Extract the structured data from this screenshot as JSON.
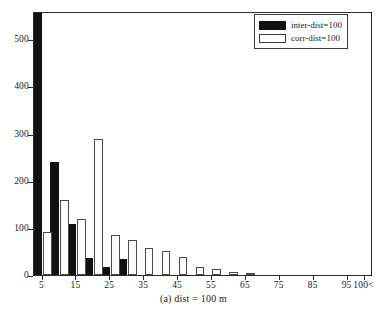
{
  "chart_data": {
    "type": "bar",
    "title": "",
    "caption": "(a) dist = 100 m",
    "xlabel": "",
    "ylabel": "",
    "ylim": [
      0,
      560
    ],
    "yticks": [
      0,
      100,
      200,
      300,
      400,
      500
    ],
    "xticklabels": [
      "5",
      "15",
      "25",
      "35",
      "45",
      "55",
      "65",
      "75",
      "85",
      "95",
      "100<"
    ],
    "xtickvalues": [
      5,
      15,
      25,
      35,
      45,
      55,
      65,
      75,
      85,
      95,
      100
    ],
    "grid": false,
    "legend_position": "top-right",
    "categories": [
      5,
      10,
      15,
      20,
      25,
      30,
      35,
      40,
      45,
      50,
      55,
      60,
      65,
      70,
      75,
      80,
      85,
      90,
      95,
      100
    ],
    "series": [
      {
        "name": "inter-dist=100",
        "color": "#111111",
        "values": [
          620,
          240,
          108,
          37,
          17,
          33,
          0,
          0,
          0,
          0,
          0,
          0,
          0,
          0,
          0,
          0,
          0,
          0,
          0,
          0
        ],
        "clipped_bins": [
          5
        ],
        "note": "first bar exceeds axis maximum and is clipped at plot top"
      },
      {
        "name": "corr-dist=100",
        "color": "#ffffff",
        "values": [
          92,
          160,
          118,
          289,
          84,
          75,
          57,
          50,
          39,
          18,
          12,
          6,
          4,
          0,
          0,
          0,
          0,
          0,
          0,
          0
        ]
      }
    ]
  },
  "legend": {
    "items": [
      {
        "label": "inter-dist=100",
        "style": "filled"
      },
      {
        "label": "corr-dist=100",
        "style": "outlined"
      }
    ]
  },
  "colors": {
    "inter": "#111111",
    "corr": "#ffffff",
    "axis": "#2b2b2b",
    "text": "#1a1a1a",
    "background": "#ffffff"
  }
}
